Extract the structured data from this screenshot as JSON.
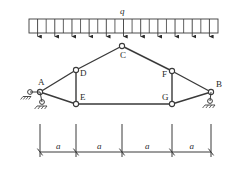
{
  "figure": {
    "background_color": "#ffffff",
    "line_color": "#3a3a3a",
    "text_color": "#2a2a2a"
  },
  "load": {
    "symbol": "q",
    "type": "uniformly-distributed-load",
    "arrow_count": 11,
    "bar_left_x": 29,
    "bar_right_x": 218,
    "bar_top_y": 19,
    "bar_bottom_y": 33,
    "direction": "down"
  },
  "nodes": [
    {
      "id": "A",
      "label": "A",
      "x": 40,
      "y": 92,
      "label_dx": -2,
      "label_dy": -14,
      "support": "pin"
    },
    {
      "id": "B",
      "label": "B",
      "x": 211,
      "y": 92,
      "label_dx": 5,
      "label_dy": -12,
      "support": "roller"
    },
    {
      "id": "C",
      "label": "C",
      "x": 122,
      "y": 46,
      "label_dx": -2,
      "label_dy": 5,
      "support": "none"
    },
    {
      "id": "D",
      "label": "D",
      "x": 76,
      "y": 70,
      "label_dx": 4,
      "label_dy": -1,
      "support": "none"
    },
    {
      "id": "E",
      "label": "E",
      "x": 76,
      "y": 104,
      "label_dx": 4,
      "label_dy": -11,
      "support": "none"
    },
    {
      "id": "F",
      "label": "F",
      "x": 172,
      "y": 71,
      "label_dx": -10,
      "label_dy": -1,
      "support": "none"
    },
    {
      "id": "G",
      "label": "G",
      "x": 172,
      "y": 104,
      "label_dx": -10,
      "label_dy": -11,
      "support": "none"
    }
  ],
  "members": [
    {
      "from": "A",
      "to": "D"
    },
    {
      "from": "D",
      "to": "C"
    },
    {
      "from": "C",
      "to": "F"
    },
    {
      "from": "F",
      "to": "B"
    },
    {
      "from": "A",
      "to": "E"
    },
    {
      "from": "E",
      "to": "G"
    },
    {
      "from": "G",
      "to": "B"
    },
    {
      "from": "D",
      "to": "E"
    },
    {
      "from": "F",
      "to": "G"
    }
  ],
  "dimensions": {
    "baseline_y": 152,
    "tick_top_y": 124,
    "labels": [
      "a",
      "a",
      "a",
      "a"
    ],
    "tick_x": [
      40,
      76,
      122,
      172,
      211
    ],
    "label_y": 142
  }
}
